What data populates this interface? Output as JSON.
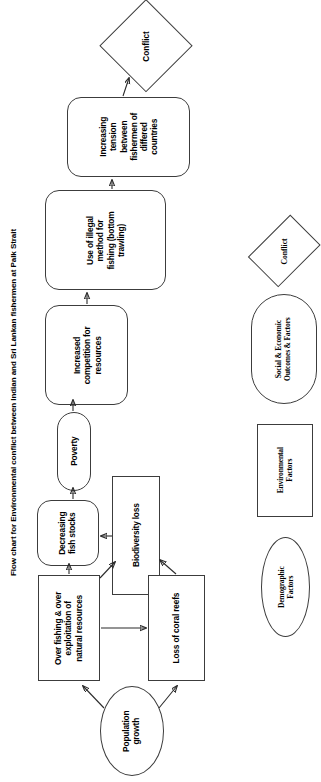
{
  "title": "Flow chart for Environmental conflict between Indian and Sri Lankan fishermen at Palk Strait",
  "flow": {
    "conflict": "Conflict",
    "tension": "Increasing tension between fishermen of differed countries",
    "illegal_method": "Use of illegal method for fishing (bottom trawling)",
    "competition": "Increased competition for resources",
    "poverty": "Poverty",
    "fish_stocks": "Decreasing fish stocks",
    "biodiversity": "Biodiversity loss",
    "overfishing": "Over fishing & over exploitation of natural resources",
    "coral": "Loss of coral reefs",
    "population": "Population growth"
  },
  "flow_lines": {
    "tension": [
      "Increasing",
      "tension",
      "between",
      "fishermen of",
      "differed",
      "countries"
    ],
    "illegal_method": [
      "Use of illegal",
      "method for",
      "fishing (bottom",
      "trawling)"
    ],
    "competition": [
      "Increased",
      "competition for",
      "resources"
    ],
    "poverty": [
      "Poverty"
    ],
    "fish_stocks": [
      "Decreasing",
      "fish stocks"
    ],
    "biodiversity": [
      "Biodiversity loss"
    ],
    "overfishing": [
      "Over fishing & over",
      "exploitation of",
      "natural resources"
    ],
    "coral": [
      "Loss of coral reefs"
    ],
    "population": [
      "Population",
      "growth"
    ],
    "conflict": [
      "Conflict"
    ]
  },
  "legend": {
    "items": [
      {
        "key": "conflict",
        "shape": "diamond",
        "label": "Conflict",
        "lines": [
          "Conflict"
        ]
      },
      {
        "key": "social-economic",
        "shape": "stadium",
        "label": "Social & Economic Outcomes & Factors",
        "lines": [
          "Social & Economic",
          "Outcomes & Factors"
        ]
      },
      {
        "key": "environmental",
        "shape": "rect",
        "label": "Environmental Factors",
        "lines": [
          "Environmental",
          "Factors"
        ]
      },
      {
        "key": "demographic",
        "shape": "ellipse",
        "label": "Demographic Factors",
        "lines": [
          "Demographic",
          "Factors"
        ]
      }
    ]
  },
  "edges": [
    {
      "from": "tension",
      "to": "conflict"
    },
    {
      "from": "illegal_method",
      "to": "tension"
    },
    {
      "from": "competition",
      "to": "illegal_method"
    },
    {
      "from": "poverty",
      "to": "competition"
    },
    {
      "from": "fish_stocks",
      "to": "poverty"
    },
    {
      "from": "biodiversity",
      "to": "fish_stocks"
    },
    {
      "from": "overfishing",
      "to": "fish_stocks"
    },
    {
      "from": "overfishing",
      "to": "biodiversity"
    },
    {
      "from": "overfishing",
      "to": "coral"
    },
    {
      "from": "coral",
      "to": "biodiversity"
    },
    {
      "from": "population",
      "to": "overfishing"
    },
    {
      "from": "population",
      "to": "coral"
    }
  ],
  "colors": {
    "stroke": "#3c3c3c",
    "arrow": "#2b2b2b",
    "background": "#ffffff",
    "text": "#000000"
  }
}
